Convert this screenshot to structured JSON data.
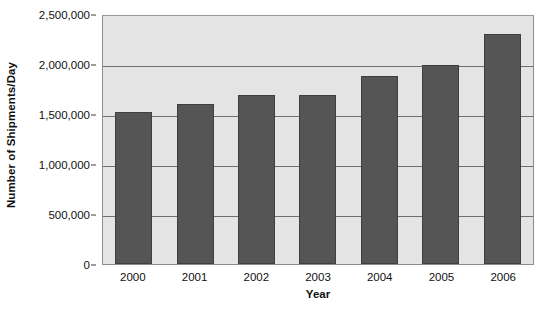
{
  "chart_data": {
    "type": "bar",
    "title": "",
    "subtitle": "",
    "xlabel": "Year",
    "ylabel": "Number of Shipments/Day",
    "categories": [
      "2000",
      "2001",
      "2002",
      "2003",
      "2004",
      "2005",
      "2006"
    ],
    "values": [
      1530000,
      1610000,
      1700000,
      1700000,
      1900000,
      2010000,
      2320000
    ],
    "series": [
      {
        "name": "Number of Shipments/Day",
        "values": [
          1530000,
          1610000,
          1700000,
          1700000,
          1900000,
          2010000,
          2320000
        ]
      }
    ],
    "ylim": [
      0,
      2500000
    ],
    "ytick_values": [
      0,
      500000,
      1000000,
      1500000,
      2000000,
      2500000
    ],
    "ytick_labels": [
      "0",
      "500,000",
      "1,000,000",
      "1,500,000",
      "2,000,000",
      "2,500,000"
    ],
    "grid": true,
    "grid_axis": "y",
    "legend": false,
    "legend_position": "none",
    "annotations": [],
    "colors": {
      "bar_fill": "#555555",
      "bar_border": "#3f3f3f",
      "plot_background": "#e4e4e4",
      "gridline": "#6e6e6e",
      "axis_line": "#8c8c8c",
      "text": "#111111",
      "page_background": "#ffffff"
    }
  }
}
